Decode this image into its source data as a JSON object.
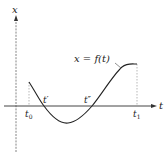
{
  "diagram": {
    "y_axis_label": "x",
    "x_axis_label": "t",
    "curve_label": "x = f(t)",
    "points": {
      "t0": "t",
      "t0_sub": "0",
      "t_prime": "t′",
      "t_double_prime": "t″",
      "t1": "t",
      "t1_sub": "1"
    },
    "colors": {
      "ink": "#222222",
      "axis": "#555555",
      "guide": "#888888"
    }
  }
}
